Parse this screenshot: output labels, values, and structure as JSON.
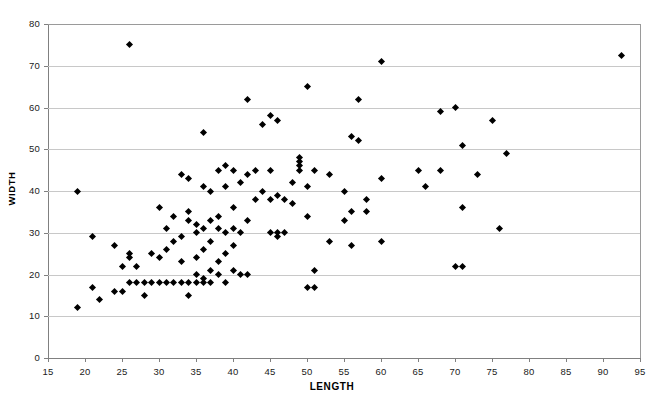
{
  "chart_data": {
    "type": "scatter",
    "title": "",
    "xlabel": "LENGTH",
    "ylabel": "WIDTH",
    "xlim": [
      15,
      95
    ],
    "ylim": [
      0,
      80
    ],
    "xticks": [
      15,
      20,
      25,
      30,
      35,
      40,
      45,
      50,
      55,
      60,
      65,
      70,
      75,
      80,
      85,
      90,
      95
    ],
    "yticks": [
      0,
      10,
      20,
      30,
      40,
      50,
      60,
      70,
      80
    ],
    "grid": "horizontal",
    "legend": "none",
    "marker": "diamond",
    "marker_color": "#000000",
    "series": [
      {
        "name": "observations",
        "points": [
          [
            19,
            12
          ],
          [
            19,
            40
          ],
          [
            21,
            17
          ],
          [
            21,
            29
          ],
          [
            22,
            14
          ],
          [
            24,
            16
          ],
          [
            24,
            27
          ],
          [
            25,
            16
          ],
          [
            25,
            22
          ],
          [
            26,
            75
          ],
          [
            26,
            18
          ],
          [
            26,
            24
          ],
          [
            26,
            25
          ],
          [
            27,
            18
          ],
          [
            27,
            22
          ],
          [
            28,
            18
          ],
          [
            28,
            15
          ],
          [
            29,
            18
          ],
          [
            29,
            25
          ],
          [
            30,
            18
          ],
          [
            30,
            24
          ],
          [
            30,
            36
          ],
          [
            31,
            18
          ],
          [
            31,
            26
          ],
          [
            31,
            31
          ],
          [
            32,
            18
          ],
          [
            32,
            28
          ],
          [
            32,
            34
          ],
          [
            33,
            18
          ],
          [
            33,
            23
          ],
          [
            33,
            29
          ],
          [
            33,
            44
          ],
          [
            34,
            18
          ],
          [
            34,
            33
          ],
          [
            34,
            35
          ],
          [
            34,
            43
          ],
          [
            34,
            15
          ],
          [
            35,
            18
          ],
          [
            35,
            20
          ],
          [
            35,
            24
          ],
          [
            35,
            30
          ],
          [
            35,
            32
          ],
          [
            36,
            18
          ],
          [
            36,
            19
          ],
          [
            36,
            26
          ],
          [
            36,
            31
          ],
          [
            36,
            41
          ],
          [
            36,
            54
          ],
          [
            37,
            18
          ],
          [
            37,
            21
          ],
          [
            37,
            28
          ],
          [
            37,
            33
          ],
          [
            37,
            40
          ],
          [
            38,
            20
          ],
          [
            38,
            23
          ],
          [
            38,
            31
          ],
          [
            38,
            34
          ],
          [
            38,
            45
          ],
          [
            39,
            18
          ],
          [
            39,
            25
          ],
          [
            39,
            30
          ],
          [
            39,
            41
          ],
          [
            39,
            46
          ],
          [
            40,
            21
          ],
          [
            40,
            27
          ],
          [
            40,
            31
          ],
          [
            40,
            36
          ],
          [
            40,
            45
          ],
          [
            41,
            20
          ],
          [
            41,
            30
          ],
          [
            41,
            42
          ],
          [
            42,
            20
          ],
          [
            42,
            33
          ],
          [
            42,
            44
          ],
          [
            42,
            62
          ],
          [
            43,
            38
          ],
          [
            43,
            45
          ],
          [
            44,
            40
          ],
          [
            44,
            56
          ],
          [
            45,
            30
          ],
          [
            45,
            38
          ],
          [
            45,
            45
          ],
          [
            45,
            58
          ],
          [
            46,
            29
          ],
          [
            46,
            30
          ],
          [
            46,
            39
          ],
          [
            46,
            57
          ],
          [
            47,
            30
          ],
          [
            47,
            38
          ],
          [
            48,
            37
          ],
          [
            48,
            42
          ],
          [
            49,
            45
          ],
          [
            49,
            46
          ],
          [
            49,
            47
          ],
          [
            49,
            48
          ],
          [
            50,
            17
          ],
          [
            50,
            34
          ],
          [
            50,
            41
          ],
          [
            50,
            65
          ],
          [
            51,
            17
          ],
          [
            51,
            21
          ],
          [
            51,
            45
          ],
          [
            53,
            28
          ],
          [
            53,
            44
          ],
          [
            55,
            33
          ],
          [
            55,
            40
          ],
          [
            56,
            27
          ],
          [
            56,
            35
          ],
          [
            56,
            53
          ],
          [
            57,
            52
          ],
          [
            57,
            62
          ],
          [
            58,
            35
          ],
          [
            58,
            38
          ],
          [
            60,
            28
          ],
          [
            60,
            43
          ],
          [
            60,
            71
          ],
          [
            65,
            45
          ],
          [
            66,
            41
          ],
          [
            68,
            45
          ],
          [
            68,
            59
          ],
          [
            70,
            22
          ],
          [
            70,
            60
          ],
          [
            71,
            22
          ],
          [
            71,
            36
          ],
          [
            71,
            51
          ],
          [
            73,
            44
          ],
          [
            75,
            57
          ],
          [
            76,
            31
          ],
          [
            77,
            49
          ],
          [
            92.5,
            72.5
          ]
        ]
      }
    ]
  },
  "axes": {
    "x_tick_labels": [
      "15",
      "20",
      "25",
      "30",
      "35",
      "40",
      "45",
      "50",
      "55",
      "60",
      "65",
      "70",
      "75",
      "80",
      "85",
      "90",
      "95"
    ],
    "y_tick_labels": [
      "0",
      "10",
      "20",
      "30",
      "40",
      "50",
      "60",
      "70",
      "80"
    ]
  },
  "colors": {
    "marker": "#000000",
    "gridline": "#c8c8c8",
    "axis": "#808080",
    "background": "#ffffff"
  }
}
